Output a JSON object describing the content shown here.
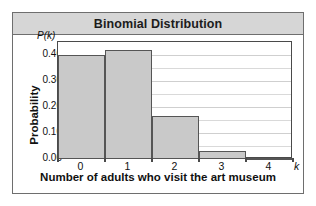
{
  "figure": {
    "title": "Binomial Distribution",
    "border_color": "#6e6e6e",
    "title_band_color": "#d6d6d6"
  },
  "chart_data": {
    "type": "bar",
    "title": "Binomial Distribution",
    "xlabel": "Number of adults who visit the art museum",
    "ylabel": "Probability",
    "x_axis_symbol": "k",
    "y_axis_symbol": "P(k)",
    "categories": [
      "0",
      "1",
      "2",
      "3",
      "4"
    ],
    "values": [
      0.4,
      0.42,
      0.165,
      0.03,
      0.002
    ],
    "ylim": [
      0.0,
      0.45
    ],
    "xlim": [
      -0.5,
      4.5
    ],
    "ytick_labels": [
      "0.00",
      "0.10",
      "0.20",
      "0.30",
      "0.40"
    ],
    "ytick_values": [
      0.0,
      0.1,
      0.2,
      0.3,
      0.4
    ],
    "minor_gridline_values": [
      0.05,
      0.15,
      0.25,
      0.35
    ],
    "grid": true,
    "grid_axis": "y",
    "legend": false,
    "bar_fill_color": "#c9c9c9",
    "bar_edge_color": "#555555",
    "plot_border_color": "#4a4a4a",
    "grid_color": "#d9d9d9"
  }
}
